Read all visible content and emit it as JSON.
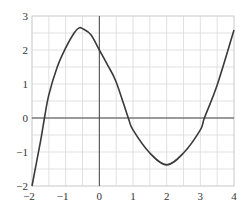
{
  "chart_data": {
    "type": "line",
    "title": "",
    "xlabel": "",
    "ylabel": "",
    "xlim": [
      -2,
      4
    ],
    "ylim": [
      -2,
      3
    ],
    "grid": true,
    "grid_step": 0.5,
    "x_ticks": [
      -2,
      -1,
      0,
      1,
      2,
      3,
      4
    ],
    "y_ticks": [
      -2,
      -1,
      0,
      1,
      2,
      3
    ],
    "x_tick_labels": [
      "−2",
      "−1",
      "0",
      "1",
      "2",
      "3",
      "4"
    ],
    "y_tick_labels": [
      "−2",
      "−1",
      "0",
      "1",
      "2",
      "3"
    ],
    "series": [
      {
        "name": "f(x)",
        "color": "#3a3a3a",
        "x": [
          -2,
          -1.75,
          -1.63,
          -1.5,
          -1.25,
          -1,
          -0.75,
          -0.6,
          -0.5,
          -0.25,
          0,
          0.25,
          0.5,
          0.86,
          1,
          1.5,
          2,
          2.5,
          3,
          3.12,
          3.5,
          4
        ],
        "y": [
          -2,
          -0.7,
          0,
          0.68,
          1.5,
          2.06,
          2.5,
          2.65,
          2.63,
          2.45,
          2.0,
          1.55,
          1.06,
          0,
          -0.35,
          -1.03,
          -1.38,
          -1.03,
          -0.35,
          0,
          0.97,
          2.59
        ]
      }
    ],
    "features": {
      "local_max": [
        -0.6,
        2.65
      ],
      "local_min": [
        2.0,
        -1.38
      ],
      "roots": [
        -1.63,
        0.86,
        3.12
      ],
      "y_intercept": 2.0
    }
  }
}
